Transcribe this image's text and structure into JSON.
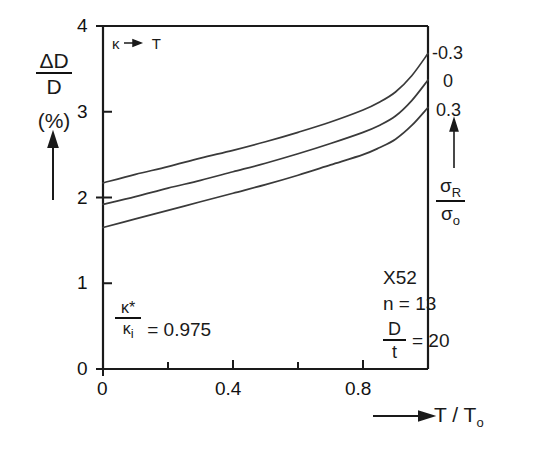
{
  "chart_data": {
    "type": "line",
    "title": "",
    "xlabel": "T / T_o",
    "ylabel": "ΔD / D (%)",
    "xlim": [
      0,
      1.0
    ],
    "ylim": [
      0,
      4
    ],
    "grid": false,
    "legend_position": "right-of-curve-ends",
    "x_ticks": [
      0,
      0.2,
      0.4,
      0.6,
      0.8,
      1.0
    ],
    "x_tick_labels": [
      "0",
      "",
      "0.4",
      "",
      "0.8",
      ""
    ],
    "y_ticks": [
      0,
      1,
      2,
      3,
      4
    ],
    "y_tick_labels": [
      "0",
      "1",
      "2",
      "3",
      "4"
    ],
    "x": [
      0,
      0.1,
      0.2,
      0.3,
      0.4,
      0.5,
      0.6,
      0.7,
      0.8,
      0.85,
      0.9,
      0.95,
      1.0
    ],
    "series": [
      {
        "name": "-0.3",
        "label": "-0.3",
        "values": [
          2.17,
          2.27,
          2.36,
          2.46,
          2.55,
          2.65,
          2.76,
          2.88,
          3.02,
          3.11,
          3.23,
          3.42,
          3.68
        ]
      },
      {
        "name": "0",
        "label": "0",
        "values": [
          1.92,
          2.01,
          2.11,
          2.2,
          2.3,
          2.4,
          2.51,
          2.63,
          2.76,
          2.84,
          2.95,
          3.13,
          3.37
        ]
      },
      {
        "name": "0.3",
        "label": "0.3",
        "values": [
          1.65,
          1.75,
          1.85,
          1.95,
          2.05,
          2.15,
          2.26,
          2.38,
          2.5,
          2.58,
          2.68,
          2.84,
          3.05
        ]
      }
    ],
    "annotations": [
      {
        "name": "kappa-to-T",
        "text": "κ → T",
        "position": "top-left-inside"
      },
      {
        "name": "kappa-ratio",
        "text": "κ* / κᵢ = 0.975",
        "position": "bottom-left-inside"
      },
      {
        "name": "material-grade",
        "text": "X52",
        "position": "bottom-right-inside"
      },
      {
        "name": "hardening-exponent",
        "text": "n = 13",
        "position": "bottom-right-inside"
      },
      {
        "name": "diameter-thickness-ratio",
        "text": "D / t = 20",
        "position": "bottom-right-inside"
      }
    ],
    "legend_title": "σ_R / σ_o"
  },
  "axes": {
    "y_label": {
      "numerator": "ΔD",
      "denominator": "D",
      "units": "(%)"
    },
    "x_label": {
      "main": "T / T",
      "subscript": "o"
    },
    "x_tick_labels": [
      "0",
      "0.4",
      "0.8"
    ],
    "y_tick_labels": [
      "4",
      "3",
      "2",
      "1",
      "0"
    ]
  },
  "annotations": {
    "kappa_to_t": "κ",
    "kappa_to_t_target": "T",
    "kappa_ratio": {
      "numerator": "κ*",
      "denominator": "κ",
      "denominator_sub": "i",
      "equals": "= 0.975"
    },
    "params": {
      "grade": "X52",
      "n": "n = 13",
      "dt_numerator": "D",
      "dt_denominator": "t",
      "dt_equals": "= 20"
    }
  },
  "legend": {
    "curve_labels": [
      "-0.3",
      "0",
      "0.3"
    ],
    "ratio_numerator": "σ",
    "ratio_numerator_sub": "R",
    "ratio_denominator": "σ",
    "ratio_denominator_sub": "o"
  },
  "colors": {
    "ink": "#1a1a1a",
    "curve": "#3a3a3a",
    "background": "#ffffff"
  }
}
